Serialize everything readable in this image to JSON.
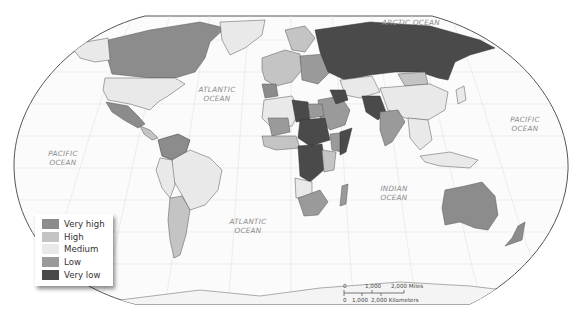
{
  "map": {
    "type": "choropleth world map",
    "projection": "Robinson-like",
    "ocean_labels": [
      {
        "id": "arctic",
        "text": "ARCTIC OCEAN",
        "x": 411,
        "y": 25,
        "lines": [
          "ARCTIC OCEAN"
        ]
      },
      {
        "id": "atlantic-north",
        "lines": [
          "ATLANTIC",
          "OCEAN"
        ],
        "x": 217,
        "y": 92
      },
      {
        "id": "pacific-east",
        "lines": [
          "PACIFIC",
          "OCEAN"
        ],
        "x": 525,
        "y": 122
      },
      {
        "id": "pacific-west",
        "lines": [
          "PACIFIC",
          "OCEAN"
        ],
        "x": 63,
        "y": 156
      },
      {
        "id": "indian",
        "lines": [
          "INDIAN",
          "OCEAN"
        ],
        "x": 394,
        "y": 191
      },
      {
        "id": "atlantic-south",
        "lines": [
          "ATLANTIC",
          "OCEAN"
        ],
        "x": 248,
        "y": 224
      }
    ],
    "colors": {
      "very_high": "#8c8c8c",
      "high": "#c4c4c4",
      "medium": "#e9e9e9",
      "low": "#9a9a9a",
      "very_low": "#4a4a4a",
      "ocean": "#fbfbfb",
      "border": "#555555"
    }
  },
  "legend": {
    "items": [
      {
        "label": "Very high",
        "color": "#8c8c8c"
      },
      {
        "label": "High",
        "color": "#c4c4c4"
      },
      {
        "label": "Medium",
        "color": "#e9e9e9"
      },
      {
        "label": "Low",
        "color": "#9a9a9a"
      },
      {
        "label": "Very low",
        "color": "#4a4a4a"
      }
    ]
  },
  "scale_bar": {
    "miles": {
      "labels": [
        "0",
        "1,000",
        "2,000 Miles"
      ]
    },
    "kilometers": {
      "labels": [
        "0",
        "1,000",
        "2,000 Kilometers"
      ]
    }
  }
}
